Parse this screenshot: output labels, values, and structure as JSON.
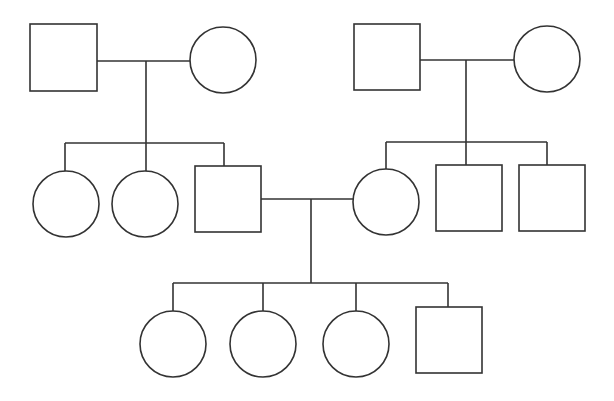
{
  "diagram": {
    "type": "pedigree",
    "stroke_color": "#333333",
    "background": "#ffffff",
    "individuals": [
      {
        "id": "g1-male-left",
        "sex": "male",
        "shape": "square",
        "x": 30,
        "y": 24,
        "size": 67
      },
      {
        "id": "g1-female-left",
        "sex": "female",
        "shape": "circle",
        "cx": 223,
        "cy": 60,
        "r": 33
      },
      {
        "id": "g1-male-right",
        "sex": "male",
        "shape": "square",
        "x": 354,
        "y": 24,
        "size": 66
      },
      {
        "id": "g1-female-right",
        "sex": "female",
        "shape": "circle",
        "cx": 547,
        "cy": 59,
        "r": 33
      },
      {
        "id": "g2-female-1",
        "sex": "female",
        "shape": "circle",
        "cx": 66,
        "cy": 204,
        "r": 33
      },
      {
        "id": "g2-female-2",
        "sex": "female",
        "shape": "circle",
        "cx": 145,
        "cy": 204,
        "r": 33
      },
      {
        "id": "g2-male-3",
        "sex": "male",
        "shape": "square",
        "x": 195,
        "y": 166,
        "size": 66
      },
      {
        "id": "g2-female-4",
        "sex": "female",
        "shape": "circle",
        "cx": 386,
        "cy": 202,
        "r": 33
      },
      {
        "id": "g2-male-5",
        "sex": "male",
        "shape": "square",
        "x": 436,
        "y": 165,
        "size": 66
      },
      {
        "id": "g2-male-6",
        "sex": "male",
        "shape": "square",
        "x": 519,
        "y": 165,
        "size": 66
      },
      {
        "id": "g3-female-1",
        "sex": "female",
        "shape": "circle",
        "cx": 173,
        "cy": 344,
        "r": 33
      },
      {
        "id": "g3-female-2",
        "sex": "female",
        "shape": "circle",
        "cx": 263,
        "cy": 344,
        "r": 33
      },
      {
        "id": "g3-female-3",
        "sex": "female",
        "shape": "circle",
        "cx": 356,
        "cy": 344,
        "r": 33
      },
      {
        "id": "g3-male-4",
        "sex": "male",
        "shape": "square",
        "x": 416,
        "y": 307,
        "size": 66
      }
    ],
    "lines": [
      {
        "id": "marriage-left",
        "x1": 97,
        "y1": 61,
        "x2": 190,
        "y2": 61
      },
      {
        "id": "descent-left",
        "x1": 146,
        "y1": 61,
        "x2": 146,
        "y2": 143
      },
      {
        "id": "sibship-left",
        "x1": 65,
        "y1": 143,
        "x2": 224,
        "y2": 143
      },
      {
        "id": "drop-left-1",
        "x1": 65,
        "y1": 143,
        "x2": 65,
        "y2": 171
      },
      {
        "id": "drop-left-2",
        "x1": 146,
        "y1": 143,
        "x2": 146,
        "y2": 171
      },
      {
        "id": "drop-left-3",
        "x1": 224,
        "y1": 143,
        "x2": 224,
        "y2": 166
      },
      {
        "id": "marriage-right",
        "x1": 420,
        "y1": 60,
        "x2": 514,
        "y2": 60
      },
      {
        "id": "descent-right",
        "x1": 466,
        "y1": 60,
        "x2": 466,
        "y2": 142
      },
      {
        "id": "sibship-right",
        "x1": 386,
        "y1": 142,
        "x2": 547,
        "y2": 142
      },
      {
        "id": "drop-right-1",
        "x1": 386,
        "y1": 142,
        "x2": 386,
        "y2": 169
      },
      {
        "id": "drop-right-2",
        "x1": 466,
        "y1": 142,
        "x2": 466,
        "y2": 165
      },
      {
        "id": "drop-right-3",
        "x1": 547,
        "y1": 142,
        "x2": 547,
        "y2": 165
      },
      {
        "id": "marriage-center",
        "x1": 261,
        "y1": 199,
        "x2": 353,
        "y2": 199
      },
      {
        "id": "descent-center",
        "x1": 311,
        "y1": 199,
        "x2": 311,
        "y2": 283
      },
      {
        "id": "sibship-bottom",
        "x1": 173,
        "y1": 283,
        "x2": 448,
        "y2": 283
      },
      {
        "id": "drop-bottom-1",
        "x1": 173,
        "y1": 283,
        "x2": 173,
        "y2": 311
      },
      {
        "id": "drop-bottom-2",
        "x1": 263,
        "y1": 283,
        "x2": 263,
        "y2": 311
      },
      {
        "id": "drop-bottom-3",
        "x1": 356,
        "y1": 283,
        "x2": 356,
        "y2": 311
      },
      {
        "id": "drop-bottom-4",
        "x1": 448,
        "y1": 283,
        "x2": 448,
        "y2": 307
      }
    ]
  }
}
